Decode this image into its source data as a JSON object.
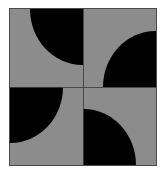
{
  "figure": {
    "background_color": "#ffffff",
    "tile_fill_color": "#8c8c8c",
    "shape_color": "#000000",
    "border_color": "#4a4a4a",
    "divider_color": "#3d3d3d",
    "grid_rows": 2,
    "grid_columns": 2,
    "disc_radius_ratio": 0.72
  },
  "tiles": [
    {
      "position": "top-left",
      "anchor_corner": "top-right",
      "shape": "quarter-circle",
      "fill": "#000000",
      "tile_fill": "#8c8c8c"
    },
    {
      "position": "top-right",
      "anchor_corner": "bottom-right",
      "shape": "quarter-circle",
      "fill": "#000000",
      "tile_fill": "#8c8c8c"
    },
    {
      "position": "bottom-left",
      "anchor_corner": "top-left",
      "shape": "quarter-circle",
      "fill": "#000000",
      "tile_fill": "#8c8c8c"
    },
    {
      "position": "bottom-right",
      "anchor_corner": "bottom-left",
      "shape": "quarter-circle",
      "fill": "#000000",
      "tile_fill": "#8c8c8c"
    }
  ]
}
